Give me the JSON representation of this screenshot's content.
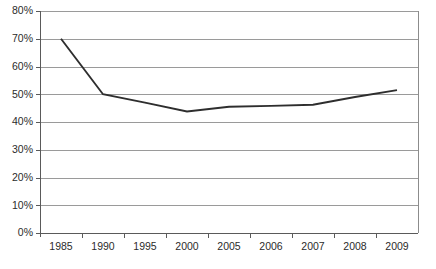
{
  "chart_data": {
    "type": "line",
    "title": "",
    "xlabel": "",
    "ylabel": "",
    "categories": [
      "1985",
      "1990",
      "1995",
      "2000",
      "2005",
      "2006",
      "2007",
      "2008",
      "2009"
    ],
    "values": [
      70,
      50,
      47,
      43.8,
      45.5,
      45.8,
      46.2,
      49,
      51.5
    ],
    "series": [
      {
        "name": "",
        "values": [
          70,
          50,
          47,
          43.8,
          45.5,
          45.8,
          46.2,
          49,
          51.5
        ]
      }
    ],
    "ylim": [
      0,
      80
    ],
    "ytick_labels": [
      "0%",
      "10%",
      "20%",
      "30%",
      "40%",
      "50%",
      "60%",
      "70%",
      "80%"
    ],
    "ytick_values": [
      0,
      10,
      20,
      30,
      40,
      50,
      60,
      70,
      80
    ],
    "xtick_labels": [
      "1985",
      "1990",
      "1995",
      "2000",
      "2005",
      "2006",
      "2007",
      "2008",
      "2009"
    ],
    "grid": true,
    "grid_axis": "y",
    "legend": false,
    "legend_position": "none",
    "annotations": [],
    "colors": {
      "line": "#2e2e2e",
      "gridline": "#9a9a9a",
      "frame": "#8c8c8c",
      "axis": "#5a5a5a",
      "text": "#2b2b2b",
      "background": "#ffffff"
    }
  },
  "layout": {
    "plot_left": 40,
    "plot_right": 418,
    "plot_top": 11,
    "plot_bottom": 233,
    "width": 436,
    "height": 269
  }
}
